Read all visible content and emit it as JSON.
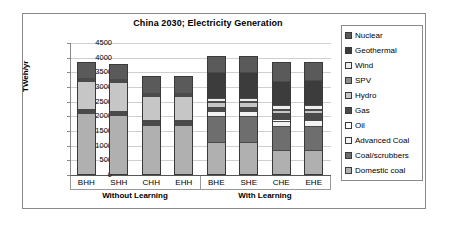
{
  "chart_data": {
    "type": "bar",
    "subtype": "stacked-vertical",
    "title": "China 2030;  Electricity Generation",
    "xlabel": "",
    "ylabel": "TWeh/yr",
    "ylim": [
      0,
      4500
    ],
    "ytick_step": 500,
    "yticks": [
      "4500",
      "4000",
      "3500",
      "3000",
      "2500",
      "2000",
      "1500",
      "1000",
      "500",
      "0"
    ],
    "grid": true,
    "legend_position": "right",
    "categories": [
      "BHH",
      "SHH",
      "CHH",
      "EHH",
      "BHE",
      "SHE",
      "CHE",
      "EHE"
    ],
    "group_labels": [
      "Without Learning",
      "With Learning"
    ],
    "group_spans": [
      [
        "BHH",
        "SHH",
        "CHH",
        "EHH"
      ],
      [
        "BHE",
        "SHE",
        "CHE",
        "EHE"
      ]
    ],
    "series": [
      {
        "name": "Domestic coal",
        "color": "#b0b0b0",
        "values": [
          2250,
          2180,
          1850,
          1840,
          1170,
          1180,
          890,
          890
        ]
      },
      {
        "name": "Coal/scrubbers",
        "color": "#6e6e6e",
        "values": [
          30,
          25,
          25,
          25,
          880,
          870,
          830,
          840
        ]
      },
      {
        "name": "Advanced Coal",
        "color": "#f2f2f2",
        "values": [
          20,
          20,
          20,
          20,
          175,
          175,
          175,
          175
        ]
      },
      {
        "name": "Oil",
        "color": "#ffffff",
        "values": [
          30,
          25,
          30,
          30,
          45,
          45,
          45,
          45
        ]
      },
      {
        "name": "Gas",
        "color": "#4a4a4a",
        "values": [
          40,
          40,
          50,
          50,
          110,
          110,
          215,
          215
        ]
      },
      {
        "name": "Hydro",
        "color": "#c6c6c6",
        "values": [
          950,
          980,
          830,
          830,
          140,
          140,
          105,
          105
        ]
      },
      {
        "name": "SPV",
        "color": "#8c8c8c",
        "values": [
          5,
          5,
          5,
          5,
          20,
          20,
          20,
          20
        ]
      },
      {
        "name": "Wind",
        "color": "#ededed",
        "values": [
          15,
          15,
          15,
          15,
          130,
          130,
          140,
          140
        ]
      },
      {
        "name": "Geothermal",
        "color": "#3c3c3c",
        "values": [
          10,
          10,
          10,
          10,
          880,
          880,
          830,
          830
        ]
      },
      {
        "name": "Nuclear",
        "color": "#5a5a5a",
        "values": [
          500,
          480,
          540,
          550,
          500,
          500,
          590,
          590
        ]
      }
    ],
    "totals": [
      3850,
      3778,
      3375,
      3375,
      4050,
      4050,
      3840,
      3850
    ],
    "legend_order_top_to_bottom": [
      "Nuclear",
      "Geothermal",
      "Wind",
      "SPV",
      "Hydro",
      "Gas",
      "Oil",
      "Advanced Coal",
      "Coal/scrubbers",
      "Domestic coal"
    ]
  },
  "legend": {
    "items": [
      {
        "label": "Nuclear",
        "color": "#5a5a5a"
      },
      {
        "label": "Geothermal",
        "color": "#3c3c3c"
      },
      {
        "label": "Wind",
        "color": "#ededed"
      },
      {
        "label": "SPV",
        "color": "#8c8c8c"
      },
      {
        "label": "Hydro",
        "color": "#c6c6c6"
      },
      {
        "label": "Gas",
        "color": "#4a4a4a"
      },
      {
        "label": "Oil",
        "color": "#ffffff"
      },
      {
        "label": "Advanced Coal",
        "color": "#f2f2f2"
      },
      {
        "label": "Coal/scrubbers",
        "color": "#6e6e6e"
      },
      {
        "label": "Domestic coal",
        "color": "#b0b0b0"
      }
    ]
  }
}
